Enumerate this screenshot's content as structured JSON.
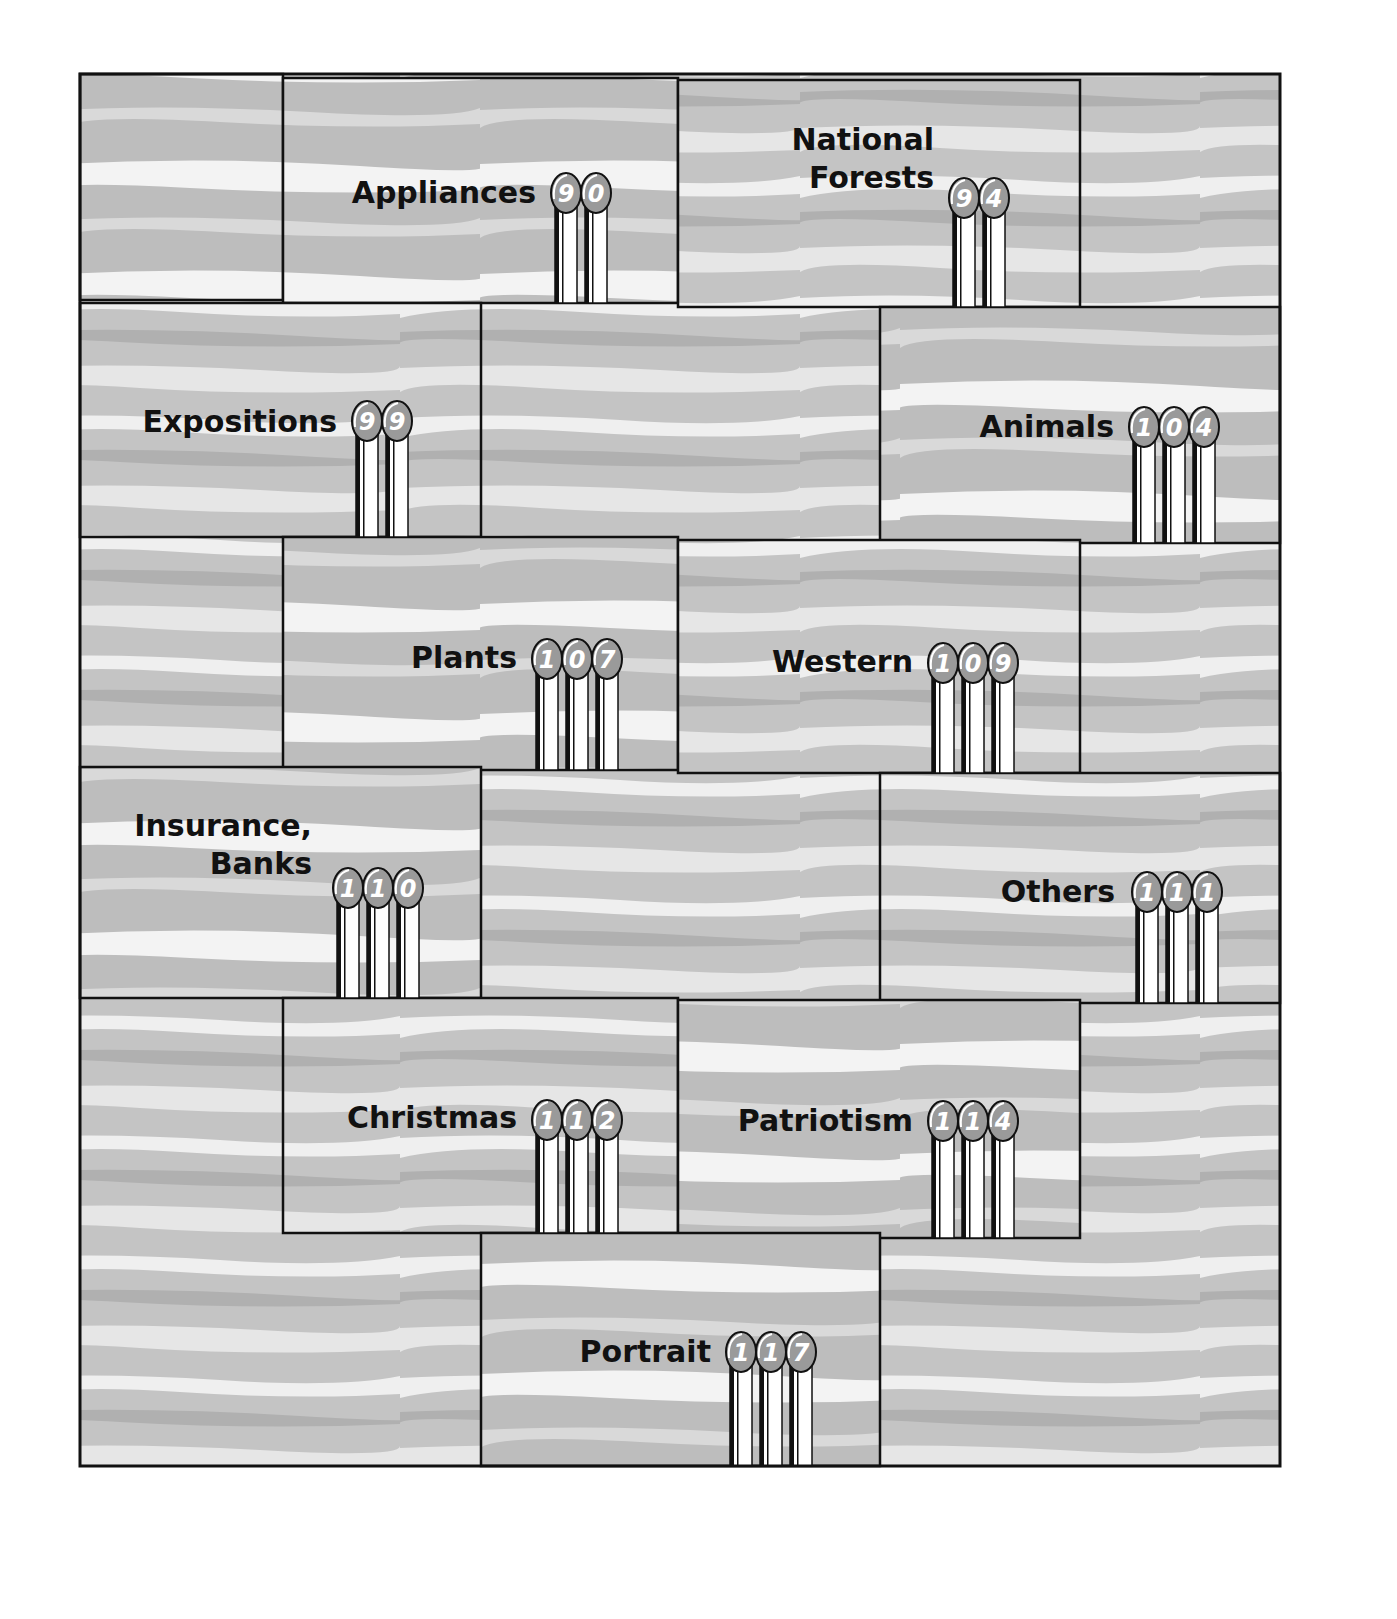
{
  "chart_data": {
    "type": "bar",
    "style": "pictorial staircase with lollipop-style post numerals",
    "title": "",
    "xlabel": "",
    "ylabel": "",
    "categories": [
      "Appliances",
      "National Forests",
      "Expositions",
      "Animals",
      "Plants",
      "Western",
      "Insurance, Banks",
      "Others",
      "Christmas",
      "Patriotism",
      "Portrait"
    ],
    "values": [
      90,
      94,
      99,
      104,
      107,
      109,
      110,
      111,
      112,
      114,
      117
    ],
    "items": [
      {
        "label_lines": [
          "Appliances"
        ],
        "value": "90"
      },
      {
        "label_lines": [
          "National",
          "Forests"
        ],
        "value": "94"
      },
      {
        "label_lines": [
          "Expositions"
        ],
        "value": "99"
      },
      {
        "label_lines": [
          "Animals"
        ],
        "value": "104"
      },
      {
        "label_lines": [
          "Plants"
        ],
        "value": "107"
      },
      {
        "label_lines": [
          "Western"
        ],
        "value": "109"
      },
      {
        "label_lines": [
          "Insurance,",
          "Banks"
        ],
        "value": "110"
      },
      {
        "label_lines": [
          "Others"
        ],
        "value": "111"
      },
      {
        "label_lines": [
          "Christmas"
        ],
        "value": "112"
      },
      {
        "label_lines": [
          "Patriotism"
        ],
        "value": "114"
      },
      {
        "label_lines": [
          "Portrait"
        ],
        "value": "117"
      }
    ],
    "grid": false,
    "legend": "none"
  },
  "colors": {
    "background": "#ffffff",
    "stripe_light": "#f2f2f2",
    "stripe_mid": "#c9c9c9",
    "stripe_dark": "#a9a9a9",
    "outline": "#111111",
    "bulb": "#9a9a9a",
    "text": "#111111"
  }
}
